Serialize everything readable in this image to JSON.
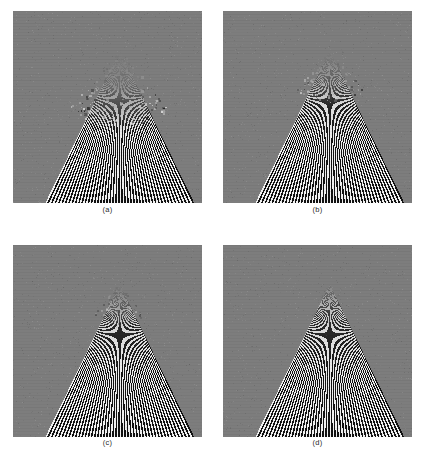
{
  "figure": {
    "kind": "four-panel-image-grid",
    "page_background": "#ffffff",
    "panel_background_gray": "#7d7d7d",
    "stripe_dark": "#111111",
    "stripe_light": "#f2f2f2",
    "columns": 2,
    "rows": 2
  },
  "panels": [
    {
      "id": "panel-a",
      "caption": "(a)",
      "x": 13,
      "y": 11,
      "width": 189,
      "height": 192,
      "caption_y": 205,
      "apex_x_frac": 0.565,
      "apex_y_frac": 0.205,
      "half_angle_deg": 26,
      "ray_count": 92,
      "aliasing": "strong",
      "alias_radius_frac": 0.42,
      "alias_strength": 1.0
    },
    {
      "id": "panel-b",
      "caption": "(b)",
      "x": 223,
      "y": 11,
      "width": 189,
      "height": 192,
      "caption_y": 205,
      "apex_x_frac": 0.565,
      "apex_y_frac": 0.205,
      "half_angle_deg": 26,
      "ray_count": 92,
      "aliasing": "moderate",
      "alias_radius_frac": 0.3,
      "alias_strength": 0.7
    },
    {
      "id": "panel-c",
      "caption": "(c)",
      "x": 13,
      "y": 245,
      "width": 189,
      "height": 192,
      "caption_y": 438,
      "apex_x_frac": 0.565,
      "apex_y_frac": 0.205,
      "half_angle_deg": 26,
      "ray_count": 92,
      "aliasing": "mild",
      "alias_radius_frac": 0.22,
      "alias_strength": 0.45
    },
    {
      "id": "panel-d",
      "caption": "(d)",
      "x": 223,
      "y": 245,
      "width": 189,
      "height": 192,
      "caption_y": 438,
      "apex_x_frac": 0.565,
      "apex_y_frac": 0.205,
      "half_angle_deg": 26,
      "ray_count": 92,
      "aliasing": "none",
      "alias_radius_frac": 0.12,
      "alias_strength": 0.12
    }
  ]
}
